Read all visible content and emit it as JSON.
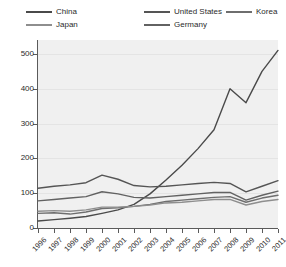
{
  "legend": {
    "items": [
      {
        "label": "China",
        "color": "#4a4a4a",
        "col": 0,
        "row": 0
      },
      {
        "label": "United States",
        "color": "#555555",
        "col": 1,
        "row": 0
      },
      {
        "label": "Korea",
        "color": "#6e6e6e",
        "col": 2,
        "row": 0
      },
      {
        "label": "Japan",
        "color": "#8e8e8e",
        "col": 0,
        "row": 1
      },
      {
        "label": "Germany",
        "color": "#626262",
        "col": 1,
        "row": 1
      }
    ]
  },
  "axes": {
    "y_ticks": [
      "0",
      "100",
      "200",
      "300",
      "400",
      "500"
    ],
    "x_ticks": [
      "1996",
      "1997",
      "1998",
      "1999",
      "2000",
      "2001",
      "2002",
      "2003",
      "2004",
      "2005",
      "2006",
      "2007",
      "2008",
      "2009",
      "2010",
      "2011"
    ]
  },
  "chart_data": {
    "type": "line",
    "title": "",
    "xlabel": "",
    "ylabel": "",
    "xlim": [
      1996,
      2011
    ],
    "ylim": [
      0,
      540
    ],
    "grid": true,
    "legend_position": "top",
    "x": [
      1996,
      1997,
      1998,
      1999,
      2000,
      2001,
      2002,
      2003,
      2004,
      2005,
      2006,
      2007,
      2008,
      2009,
      2010,
      2011
    ],
    "series": [
      {
        "name": "China",
        "color": "#4a4a4a",
        "values": [
          20,
          24,
          28,
          33,
          42,
          52,
          68,
          98,
          138,
          180,
          228,
          282,
          400,
          360,
          450,
          510
        ]
      },
      {
        "name": "United States",
        "color": "#555555",
        "values": [
          114,
          120,
          124,
          130,
          152,
          140,
          122,
          118,
          120,
          124,
          128,
          131,
          128,
          104,
          120,
          136
        ]
      },
      {
        "name": "Germany",
        "color": "#626262",
        "values": [
          78,
          82,
          86,
          90,
          104,
          98,
          88,
          86,
          90,
          94,
          98,
          102,
          102,
          80,
          94,
          106
        ]
      },
      {
        "name": "Korea",
        "color": "#6e6e6e",
        "values": [
          42,
          44,
          40,
          46,
          56,
          58,
          62,
          68,
          76,
          80,
          84,
          88,
          90,
          74,
          86,
          94
        ]
      },
      {
        "name": "Japan",
        "color": "#8e8e8e",
        "values": [
          48,
          50,
          48,
          52,
          60,
          60,
          62,
          66,
          72,
          74,
          78,
          82,
          82,
          66,
          76,
          82
        ]
      }
    ]
  }
}
